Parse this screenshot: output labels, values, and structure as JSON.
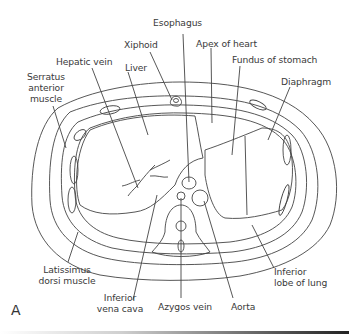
{
  "figure": {
    "panel_label": "A",
    "type": "cross-sectional anatomy line drawing",
    "labels": {
      "esophagus": "Esophagus",
      "xiphoid": "Xiphoid",
      "apex_of_heart": "Apex of heart",
      "hepatic_vein": "Hepatic vein",
      "liver": "Liver",
      "fundus_of_stomach": "Fundus of stomach",
      "serratus_line1": "Serratus",
      "serratus_line2": "anterior",
      "serratus_line3": "muscle",
      "diaphragm": "Diaphragm",
      "latissimus_line1": "Latissimus",
      "latissimus_line2": "dorsi muscle",
      "ivc_line1": "Inferior",
      "ivc_line2": "vena cava",
      "azygos_vein": "Azygos vein",
      "aorta": "Aorta",
      "inferior_lobe_line1": "Inferior",
      "inferior_lobe_line2": "lobe of lung"
    }
  }
}
